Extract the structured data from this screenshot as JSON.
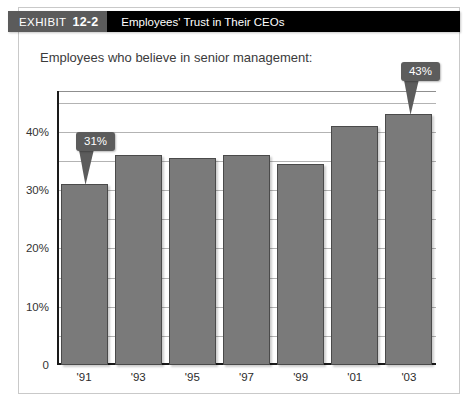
{
  "header": {
    "tag_word": "EXHIBIT",
    "tag_number": "12-2",
    "title": "Employees' Trust in Their CEOs"
  },
  "chart_data": {
    "type": "bar",
    "title": "Employees' Trust in Their CEOs",
    "subtitle": "Employees who believe in senior management:",
    "xlabel": "",
    "ylabel": "",
    "categories": [
      "'91",
      "'93",
      "'95",
      "'97",
      "'99",
      "'01",
      "'03"
    ],
    "values": [
      31,
      36,
      35.5,
      36,
      34.5,
      41,
      43
    ],
    "ylim": [
      0,
      47
    ],
    "ytick_values": [
      0,
      10,
      20,
      30,
      40
    ],
    "ytick_labels": [
      "0",
      "10%",
      "20%",
      "30%",
      "40%"
    ],
    "minor_gridline_values": [
      5,
      15,
      25,
      35,
      45
    ],
    "grid": true,
    "legend": "none",
    "bar_color": "#7a7a7a",
    "bar_border_color": "#4a4a4a",
    "annotations": [
      {
        "label": "31%",
        "category": "'91",
        "value": 31
      },
      {
        "label": "43%",
        "category": "'03",
        "value": 43
      }
    ]
  }
}
